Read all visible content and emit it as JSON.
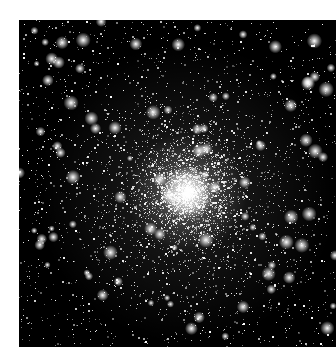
{
  "image": {
    "subject": "Globular star cluster",
    "alt": "Dense globular star cluster with a bright white core on a black sky background",
    "frame": {
      "left": 19,
      "top": 20,
      "width": 317,
      "height": 327
    },
    "background_color": "#000000",
    "page_background_color": "#ffffff",
    "star_color": "#ffffff",
    "core": {
      "x": 168,
      "y": 173,
      "radius": 38,
      "halo_radius": 150
    },
    "star_count": 5200,
    "bright_star_count": 90,
    "seed": 42
  }
}
